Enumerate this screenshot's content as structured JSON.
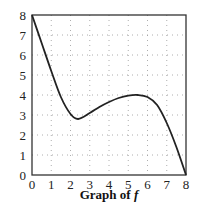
{
  "chart_data": {
    "type": "line",
    "title": "",
    "caption": "Graph of",
    "caption_var": "f",
    "xlabel": "",
    "ylabel": "",
    "xlim": [
      0,
      8
    ],
    "ylim": [
      0,
      8
    ],
    "x_ticks": [
      "0",
      "1",
      "2",
      "3",
      "4",
      "5",
      "6",
      "7",
      "8"
    ],
    "y_ticks": [
      "0",
      "1",
      "2",
      "3",
      "4",
      "5",
      "6",
      "7",
      "8"
    ],
    "grid": "dotted",
    "series": [
      {
        "name": "f",
        "x": [
          0,
          0.5,
          1,
          1.5,
          2,
          2.4,
          3,
          3.5,
          4,
          4.5,
          5,
          5.5,
          6,
          6.5,
          7,
          7.5,
          8
        ],
        "y": [
          8,
          6.6,
          5.2,
          3.9,
          3.05,
          2.8,
          3.1,
          3.4,
          3.65,
          3.85,
          3.97,
          4.0,
          3.9,
          3.5,
          2.6,
          1.4,
          0
        ]
      }
    ],
    "features": {
      "local_min": [
        2.4,
        2.8
      ],
      "local_max": [
        5.5,
        4.0
      ],
      "endpoints": [
        [
          0,
          8
        ],
        [
          8,
          0
        ]
      ]
    },
    "colors": {
      "curve": "#222222",
      "frame": "#333333",
      "grid": "#999999"
    }
  }
}
